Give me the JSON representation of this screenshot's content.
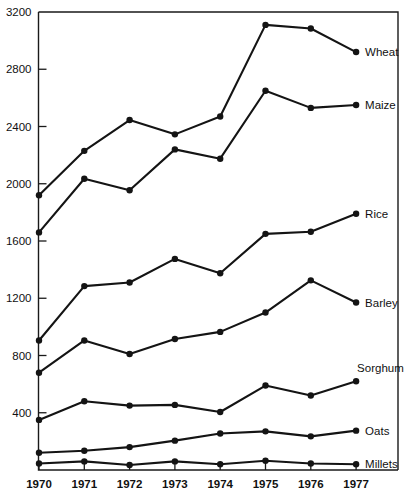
{
  "chart_data": {
    "type": "line",
    "title": "",
    "subtitle": "",
    "xlabel": "",
    "ylabel": "",
    "grid": false,
    "legend_position": "right-inline-labels",
    "x": [
      1970,
      1971,
      1972,
      1973,
      1974,
      1975,
      1976,
      1977
    ],
    "categories": [
      "1970",
      "1971",
      "1972",
      "1973",
      "1974",
      "1975",
      "1976",
      "1977"
    ],
    "xlim": [
      1969.55,
      1977.35
    ],
    "ylim": [
      0,
      3200
    ],
    "ytick_labels": [
      "400",
      "800",
      "1200",
      "1600",
      "2000",
      "2400",
      "2800",
      "3200"
    ],
    "yticks": [
      400,
      800,
      1200,
      1600,
      2000,
      2400,
      2800,
      3200
    ],
    "series": [
      {
        "name": "Wheat",
        "values": [
          1920,
          2230,
          2445,
          2345,
          2470,
          3110,
          3085,
          2920
        ]
      },
      {
        "name": "Maize",
        "values": [
          1660,
          2035,
          1955,
          2240,
          2175,
          2650,
          2530,
          2550
        ]
      },
      {
        "name": "Rice",
        "values": [
          905,
          1285,
          1310,
          1475,
          1375,
          1650,
          1665,
          1790
        ]
      },
      {
        "name": "Barley",
        "values": [
          680,
          905,
          810,
          915,
          965,
          1100,
          1325,
          1170
        ]
      },
      {
        "name": "Sorghum",
        "values": [
          350,
          480,
          450,
          455,
          405,
          590,
          520,
          620
        ]
      },
      {
        "name": "Oats",
        "values": [
          120,
          135,
          160,
          205,
          255,
          270,
          235,
          275
        ]
      },
      {
        "name": "Millets",
        "values": [
          45,
          60,
          35,
          60,
          40,
          65,
          45,
          40
        ]
      }
    ]
  },
  "style": {
    "line_color": "#141414",
    "marker_color": "#141414",
    "text_color": "#111111",
    "background": "#ffffff"
  }
}
